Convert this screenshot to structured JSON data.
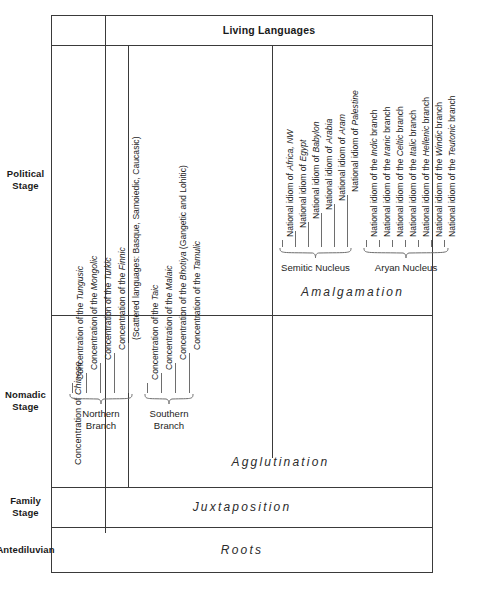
{
  "header": {
    "living_languages": "Living Languages"
  },
  "stages": [
    {
      "id": "political",
      "lines": [
        "Political",
        "Stage"
      ]
    },
    {
      "id": "nomadic",
      "lines": [
        "Nomadic",
        "Stage"
      ]
    },
    {
      "id": "family",
      "lines": [
        "Family",
        "Stage"
      ]
    },
    {
      "id": "antediluvian",
      "lines": [
        "Antediluvian"
      ]
    }
  ],
  "modes": {
    "amalgamation": "Amalgamation",
    "agglutination": "Agglutination",
    "juxtaposition": "Juxtaposition",
    "roots": "Roots"
  },
  "chinese": {
    "prefix": "Concentration of ",
    "italic": "Chinese"
  },
  "groups": [
    {
      "id": "northern-branch",
      "label": "Northern\nBranch",
      "label_line1": "Northern",
      "label_line2": "Branch"
    },
    {
      "id": "southern-branch",
      "label": "Southern\nBranch",
      "label_line1": "Southern",
      "label_line2": "Branch"
    },
    {
      "id": "semitic-nucleus",
      "label": "Semitic Nucleus"
    },
    {
      "id": "aryan-nucleus",
      "label": "Aryan Nucleus"
    }
  ],
  "northern_items": [
    {
      "prefix": "Concentration of the ",
      "italic": "Tungusic",
      "suffix": ""
    },
    {
      "prefix": "Concentration of the ",
      "italic": "Mongolic",
      "suffix": ""
    },
    {
      "prefix": "Concentration of the ",
      "italic": "Turkic",
      "suffix": ""
    },
    {
      "prefix": "Concentration of the ",
      "italic": "Finnic",
      "suffix": ""
    },
    {
      "prefix": "(Scattered languages:  Basque, Samoiedic, Caucasic)",
      "italic": "",
      "suffix": ""
    }
  ],
  "southern_items": [
    {
      "prefix": "Concentration of the ",
      "italic": "Taic",
      "suffix": ""
    },
    {
      "prefix": "Concentration of the ",
      "italic": "Malaic",
      "suffix": ""
    },
    {
      "prefix": "Concentration of the ",
      "italic": "Bhotiya",
      "suffix": " (Gangetic and Lohitic)"
    },
    {
      "prefix": "Concentration of the ",
      "italic": "Tamulic",
      "suffix": ""
    }
  ],
  "semitic_items": [
    {
      "prefix": "National idiom of ",
      "italic": "Africa, NW",
      "suffix": ""
    },
    {
      "prefix": "National idiom of ",
      "italic": "Egypt",
      "suffix": ""
    },
    {
      "prefix": "National idiom of ",
      "italic": "Babylon",
      "suffix": ""
    },
    {
      "prefix": "National idiom of ",
      "italic": "Arabia",
      "suffix": ""
    },
    {
      "prefix": "National idiom of ",
      "italic": "Aram",
      "suffix": ""
    },
    {
      "prefix": "National idiom of ",
      "italic": "Palestine",
      "suffix": ""
    }
  ],
  "aryan_items": [
    {
      "prefix": "National idiom of the ",
      "italic": "Indic",
      "suffix": " branch"
    },
    {
      "prefix": "National idiom of the ",
      "italic": "Iranic",
      "suffix": " branch"
    },
    {
      "prefix": "National idiom of the ",
      "italic": "Celtic",
      "suffix": " branch"
    },
    {
      "prefix": "National idiom of the ",
      "italic": "Italic",
      "suffix": " branch"
    },
    {
      "prefix": "National idiom of the ",
      "italic": "Hellenic",
      "suffix": " branch"
    },
    {
      "prefix": "National idiom of the ",
      "italic": "Windic",
      "suffix": " branch"
    },
    {
      "prefix": "National idiom of the ",
      "italic": "Teutonic",
      "suffix": " branch"
    }
  ],
  "colors": {
    "rule": "#3a3a3a",
    "text": "#1a1a1a",
    "tick": "#6e6e6e"
  }
}
